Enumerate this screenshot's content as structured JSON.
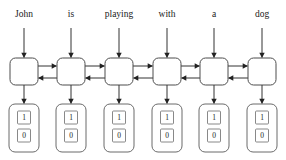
{
  "diagram": {
    "type": "bidirectional-rnn",
    "colors": {
      "background": "#ffffff",
      "cell_stroke": "#4d4d4d",
      "output_stroke": "#6b6b6b",
      "arrow": "#333333",
      "text": "#1a1a1a"
    },
    "geometry": {
      "width": 286,
      "height": 160,
      "column_centers": [
        24,
        71,
        119,
        167,
        214,
        262
      ],
      "label_baseline_y": 17,
      "input_arrow_top_y": 28,
      "cell_top_y": 58,
      "cell_bottom_y": 85,
      "cell_half_width": 14,
      "forward_arrow_y": 66,
      "backward_arrow_y": 78,
      "output_top_y": 104,
      "output_bottom_y": 152,
      "output_half_width": 15
    },
    "timesteps": [
      {
        "index": 0,
        "word": "John",
        "cell_name": "rnn-cell-1",
        "output": {
          "top_value": "1",
          "bottom_value": "0"
        }
      },
      {
        "index": 1,
        "word": "is",
        "cell_name": "rnn-cell-2",
        "output": {
          "top_value": "1",
          "bottom_value": "0"
        }
      },
      {
        "index": 2,
        "word": "playing",
        "cell_name": "rnn-cell-3",
        "output": {
          "top_value": "1",
          "bottom_value": "0"
        }
      },
      {
        "index": 3,
        "word": "with",
        "cell_name": "rnn-cell-4",
        "output": {
          "top_value": "1",
          "bottom_value": "0"
        }
      },
      {
        "index": 4,
        "word": "a",
        "cell_name": "rnn-cell-5",
        "output": {
          "top_value": "1",
          "bottom_value": "0"
        }
      },
      {
        "index": 5,
        "word": "dog",
        "cell_name": "rnn-cell-6",
        "output": {
          "top_value": "1",
          "bottom_value": "0"
        }
      }
    ],
    "sentence": "John is playing with a dog",
    "connections": {
      "forward_direction": "left-to-right",
      "backward_direction": "right-to-left",
      "input_direction": "top-to-bottom",
      "output_direction": "top-to-bottom"
    }
  }
}
